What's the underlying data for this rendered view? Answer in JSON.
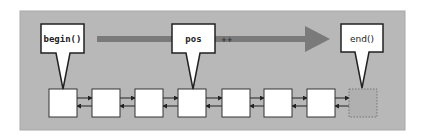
{
  "diagram": {
    "type": "linked-list-iterators",
    "colors": {
      "panel": "#b8b8b8",
      "panel_border": "#a0a0a0",
      "node_fill": "#ffffff",
      "node_stroke": "#333333",
      "end_node_fill": "#b0b0b0",
      "arrow": "#7a7a7a",
      "callout_fill": "#ffffff",
      "callout_stroke": "#222222"
    },
    "callouts": [
      {
        "label": "begin()",
        "target_node": 0
      },
      {
        "label": "pos",
        "target_node": 3
      },
      {
        "label": "end()",
        "target_node": 7
      }
    ],
    "direction_arrow": {
      "marker": "++"
    },
    "nodes": [
      {
        "index": 0,
        "kind": "element"
      },
      {
        "index": 1,
        "kind": "element"
      },
      {
        "index": 2,
        "kind": "element"
      },
      {
        "index": 3,
        "kind": "element"
      },
      {
        "index": 4,
        "kind": "element"
      },
      {
        "index": 5,
        "kind": "element"
      },
      {
        "index": 6,
        "kind": "element"
      },
      {
        "index": 7,
        "kind": "past-the-end"
      }
    ]
  }
}
